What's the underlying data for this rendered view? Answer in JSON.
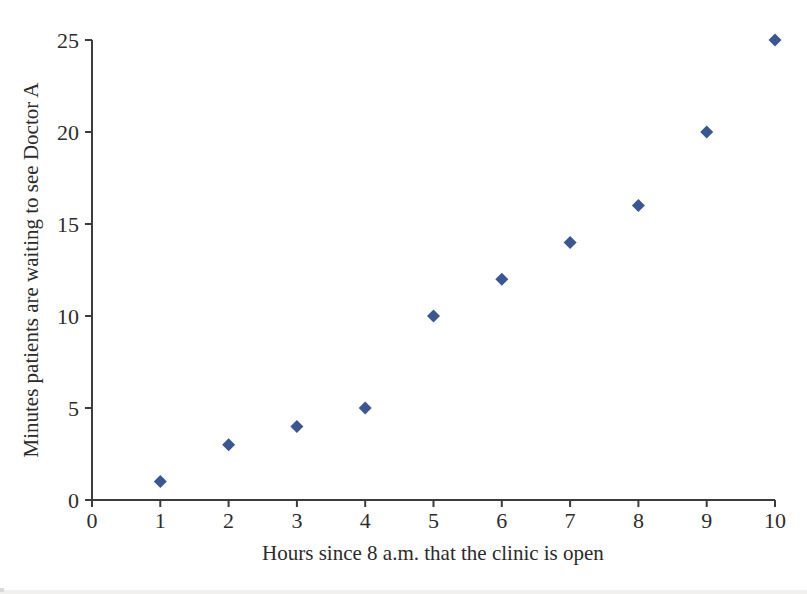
{
  "figure": {
    "background_color": "#ffffff"
  },
  "chart_data": {
    "type": "scatter",
    "title": "",
    "xlabel": "Hours since 8 a.m. that the clinic is open",
    "ylabel": "Minutes patients are waiting to see Doctor A",
    "x": [
      1,
      2,
      3,
      4,
      5,
      6,
      7,
      8,
      9,
      10
    ],
    "y": [
      1,
      3,
      4,
      5,
      10,
      12,
      14,
      16,
      20,
      25
    ],
    "xlim": [
      0,
      10
    ],
    "ylim": [
      0,
      25
    ],
    "xticks": [
      0,
      1,
      2,
      3,
      4,
      5,
      6,
      7,
      8,
      9,
      10
    ],
    "yticks": [
      0,
      5,
      10,
      15,
      20,
      25
    ],
    "grid": false,
    "legend": "none",
    "marker": {
      "shape": "diamond",
      "color": "#3a5794",
      "size_px": 13
    },
    "axis_color": "#3c3c3c",
    "text_color": "#2d2d2d",
    "scan_artifact_color": "#f1f0ee"
  }
}
